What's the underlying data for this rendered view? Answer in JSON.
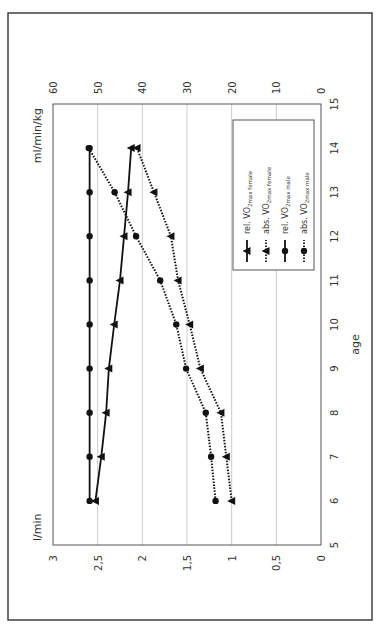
{
  "chart_data": {
    "type": "line",
    "orientation": "rotated 90 degrees counter-clockwise",
    "title": "",
    "xlabel": "age",
    "ylabel_left": "l/min",
    "ylabel_right": "ml/min/kg",
    "x": [
      6,
      7,
      8,
      9,
      10,
      11,
      12,
      13,
      14
    ],
    "xlim": [
      5,
      15
    ],
    "x_ticks": [
      "5",
      "6",
      "7",
      "8",
      "9",
      "10",
      "11",
      "12",
      "13",
      "14",
      "15"
    ],
    "ylim_left": [
      0,
      3
    ],
    "y_ticks_left": [
      "0",
      "0,5",
      "1",
      "1,5",
      "2",
      "2,5",
      "3"
    ],
    "ylim_right": [
      0,
      60
    ],
    "y_ticks_right": [
      "0",
      "10",
      "20",
      "30",
      "40",
      "50",
      "60"
    ],
    "grid": "horizontal gridlines at left-axis ticks",
    "legend_position": "upper right (inside plot)",
    "series": [
      {
        "name": "rel. VO2max female",
        "label_main": "rel. VO",
        "label_sub": "2max female",
        "axis": "right",
        "line": "solid",
        "marker": "triangle",
        "values": [
          50.5,
          49.2,
          48.1,
          47.5,
          46.3,
          45.0,
          44.1,
          43.2,
          42.5
        ]
      },
      {
        "name": "abs. VO2max female",
        "label_main": "abs. VO",
        "label_sub": "2max female",
        "axis": "left",
        "line": "dotted",
        "marker": "triangle",
        "values": [
          1.0,
          1.06,
          1.12,
          1.35,
          1.47,
          1.6,
          1.68,
          1.87,
          2.06
        ]
      },
      {
        "name": "rel. VO2max male",
        "label_main": "rel. VO",
        "label_sub": "2max male",
        "axis": "right",
        "line": "solid",
        "marker": "circle",
        "values": [
          51.8,
          51.8,
          51.8,
          51.8,
          51.8,
          51.8,
          51.8,
          51.8,
          51.8
        ]
      },
      {
        "name": "abs. VO2max male",
        "label_main": "abs. VO",
        "label_sub": "2max male",
        "axis": "left",
        "line": "dotted",
        "marker": "circle",
        "values": [
          1.18,
          1.23,
          1.29,
          1.51,
          1.62,
          1.8,
          2.07,
          2.31,
          2.6
        ]
      }
    ]
  },
  "colors": {
    "line": "#111111",
    "grid": "#cccccc",
    "axis": "#555555",
    "frame": "#333333",
    "text": "#333333"
  }
}
